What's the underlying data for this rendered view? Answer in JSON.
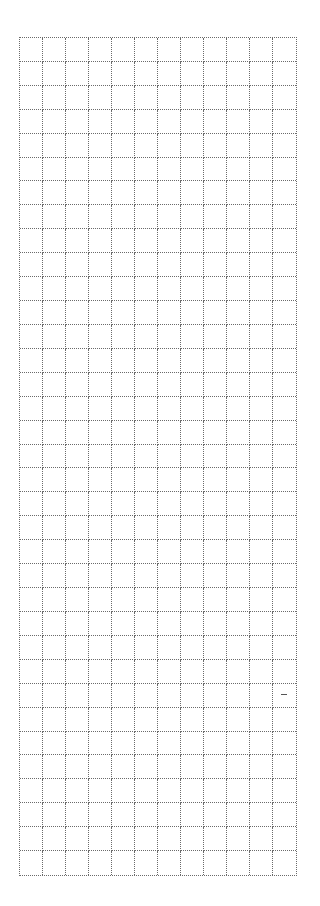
{
  "grid": {
    "columns": 12,
    "rows": 35,
    "line_color": "#6a6a6a",
    "line_style": "dotted",
    "background": "#ffffff"
  },
  "marks": [
    {
      "name": "stray-dash-mark",
      "left": 281,
      "top": 694
    }
  ]
}
